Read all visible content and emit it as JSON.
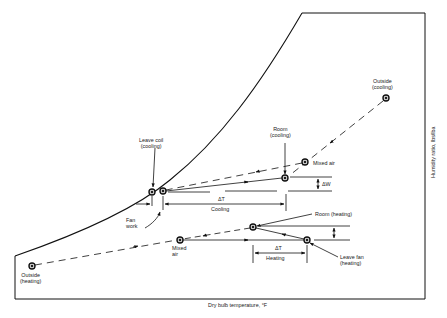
{
  "diagram": {
    "type": "psychrometric-process-diagram",
    "axes": {
      "x_label": "Dry bulb temperature, °F",
      "y_label": "Humidity ratio, lbs/lba"
    },
    "points": {
      "outside_heating": {
        "line1": "Outside",
        "line2": "(heating)"
      },
      "mixed_air_heating": {
        "line1": "Mixed",
        "line2": "air"
      },
      "room_heating": {
        "label": "Room (heating)"
      },
      "leave_fan_heating": {
        "line1": "Leave fan",
        "line2": "(heating)"
      },
      "leave_coil_cooling": {
        "line1": "Leave coil",
        "line2": "(cooling)"
      },
      "room_cooling": {
        "line1": "Room",
        "line2": "(cooling)"
      },
      "mixed_air_cooling": {
        "label": "Mixed air"
      },
      "outside_cooling": {
        "line1": "Outside",
        "line2": "(cooling)"
      }
    },
    "annotations": {
      "fan_work": {
        "line1": "Fan",
        "line2": "work"
      },
      "delta_t_cooling": {
        "symbol": "ΔT",
        "label": "Cooling"
      },
      "delta_t_heating": {
        "symbol": "ΔT",
        "label": "Heating"
      },
      "delta_w": "ΔW"
    }
  }
}
